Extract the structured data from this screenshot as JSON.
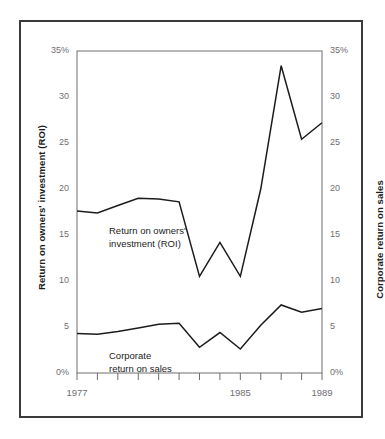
{
  "figure": {
    "background_color": "#ffffff",
    "frame_color": "#3a3a3c",
    "line_color": "#1c1c1e",
    "tick_color": "#6e6e73"
  },
  "chart_data": {
    "type": "line",
    "title": "",
    "xlabel": "",
    "ylabel": "Return on owners' investment (ROI)",
    "y2label": "Corporate return on sales",
    "x": [
      1977,
      1978,
      1979,
      1980,
      1981,
      1982,
      1983,
      1984,
      1985,
      1986,
      1987,
      1988,
      1989
    ],
    "xlim": [
      1977,
      1989
    ],
    "xticks": [
      1977,
      1978,
      1979,
      1980,
      1981,
      1982,
      1983,
      1984,
      1985,
      1986,
      1987,
      1988,
      1989
    ],
    "xticklabels": [
      "1977",
      "",
      "",
      "",
      "",
      "",
      "",
      "",
      "1985",
      "",
      "",
      "",
      "1989"
    ],
    "ylim": [
      0,
      35
    ],
    "yticks": [
      0,
      5,
      10,
      15,
      20,
      25,
      30,
      35
    ],
    "yticklabels": [
      "0%",
      "5",
      "10",
      "15",
      "20",
      "25",
      "30",
      "35%"
    ],
    "y2lim": [
      0,
      35
    ],
    "y2ticks": [
      0,
      5,
      10,
      15,
      20,
      25,
      30,
      35
    ],
    "y2ticklabels": [
      "0%",
      "5",
      "10",
      "15",
      "20",
      "25",
      "30",
      "35%"
    ],
    "grid": false,
    "legend": "annotations-inline",
    "series": [
      {
        "name": "Return on owners' investment (ROI)",
        "axis": "left",
        "annotation": "Return on owners'\ninvestment (ROI)",
        "values": [
          17.6,
          17.4,
          18.2,
          19.0,
          18.9,
          18.6,
          10.5,
          14.2,
          10.5,
          20.0,
          33.4,
          25.4,
          27.2
        ]
      },
      {
        "name": "Corporate return on sales",
        "axis": "right",
        "annotation": "Corporate\nreturn on sales",
        "values": [
          4.3,
          4.2,
          4.5,
          4.9,
          5.3,
          5.4,
          2.8,
          4.4,
          2.6,
          5.2,
          7.4,
          6.6,
          7.0
        ]
      }
    ]
  },
  "axes": {
    "left_title": "Return on owners' investment (ROI)",
    "right_title": "Corporate return on sales"
  },
  "annotations": {
    "roi_line1": "Return on owners'",
    "roi_line2": "investment (ROI)",
    "sales_line1": "Corporate",
    "sales_line2": "return on sales"
  }
}
